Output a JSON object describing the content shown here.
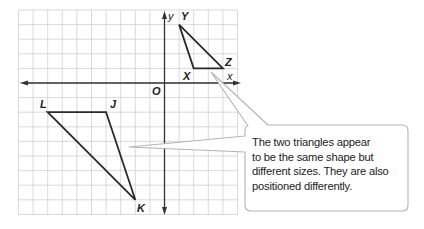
{
  "diagram": {
    "type": "coordinate-plane-similar-triangles",
    "grid": {
      "columns": 15,
      "rows": 14,
      "origin_label": "O",
      "x_axis_label": "x",
      "y_axis_label": "y"
    },
    "triangles": [
      {
        "name": "XYZ",
        "vertices": [
          {
            "label": "X",
            "x": 2,
            "y": 1
          },
          {
            "label": "Y",
            "x": 1,
            "y": 4
          },
          {
            "label": "Z",
            "x": 4,
            "y": 1
          }
        ]
      },
      {
        "name": "JKL",
        "vertices": [
          {
            "label": "J",
            "x": -4,
            "y": -2
          },
          {
            "label": "K",
            "x": -2,
            "y": -8
          },
          {
            "label": "L",
            "x": -8,
            "y": -2
          }
        ]
      }
    ],
    "labels": {
      "X": "X",
      "Y": "Y",
      "Z": "Z",
      "J": "J",
      "K": "K",
      "L": "L",
      "O": "O",
      "x_axis": "x",
      "y_axis": "y"
    },
    "callout": {
      "lines": [
        "The two triangles appear",
        "to be the same shape but",
        "different sizes. They are also",
        "positioned differently."
      ]
    },
    "colors": {
      "grid": "#c8c8c8",
      "axes": "#333333",
      "triangle": "#2a2a2a",
      "callout_border": "#b4b4b4",
      "text": "#222222"
    }
  }
}
